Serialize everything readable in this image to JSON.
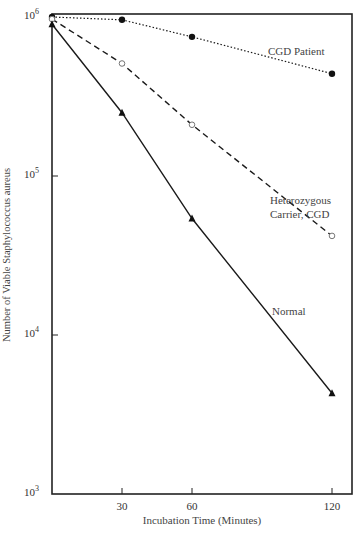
{
  "chart_data": {
    "type": "line",
    "title": "",
    "xlabel": "Incubation Time (Minutes)",
    "ylabel": "Number of Viable Staphylococcus aureus",
    "yscale": "log",
    "ylim": [
      1000,
      1000000
    ],
    "xlim": [
      0,
      120
    ],
    "x_ticks": [
      30,
      60,
      120
    ],
    "y_ticks": [
      {
        "value": 1000,
        "label_base": "10",
        "label_exp": "3"
      },
      {
        "value": 10000,
        "label_base": "10",
        "label_exp": "4"
      },
      {
        "value": 100000,
        "label_base": "10",
        "label_exp": "5"
      },
      {
        "value": 1000000,
        "label_base": "10",
        "label_exp": "6"
      }
    ],
    "grid": false,
    "x": [
      0,
      30,
      60,
      120
    ],
    "series": [
      {
        "name": "CGD Patient",
        "label": "CGD Patient",
        "style": "dotted",
        "marker": "filled-circle",
        "values": [
          1000000,
          960000,
          750000,
          440000
        ]
      },
      {
        "name": "Heterozygous Carrier, CGD",
        "label_line1": "Heterozygous",
        "label_line2": "Carrier, CGD",
        "style": "dashed",
        "marker": "open-circle",
        "values": [
          970000,
          510000,
          210000,
          42000
        ]
      },
      {
        "name": "Normal",
        "label": "Normal",
        "style": "solid",
        "marker": "filled-triangle",
        "values": [
          900000,
          250000,
          54000,
          4300
        ]
      }
    ]
  },
  "colors": {
    "line": "#1a1a1a",
    "axis": "#222222",
    "text": "#444444"
  }
}
